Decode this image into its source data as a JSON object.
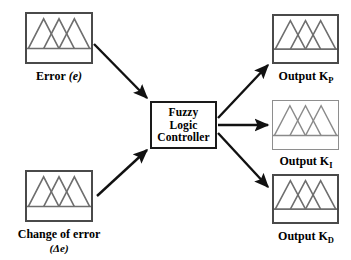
{
  "diagram": {
    "colors": {
      "background": "#ffffff",
      "box_border": "#4a4a4a",
      "box_border_light": "#8e8e8e",
      "controller_border": "#1a1a1a",
      "arrow": "#111111",
      "curve": "#6e6e6e",
      "text": "#000000"
    },
    "controller": {
      "line1": "Fuzzy",
      "line2": "Logic",
      "line3": "Controller"
    },
    "inputs": [
      {
        "id": "error",
        "label_main": "Error",
        "label_paren": "(e)",
        "label_sub": "",
        "plot": {
          "type": "membership-functions",
          "shape": "triangular",
          "count": 3,
          "peaks": [
            0.26,
            0.5,
            0.74
          ],
          "half_width": 0.24,
          "baseline": 0.72
        }
      },
      {
        "id": "change-of-error",
        "label_main": "Change of error",
        "label_paren": "(Δe)",
        "label_sub": "",
        "plot": {
          "type": "membership-functions",
          "shape": "triangular",
          "count": 3,
          "peaks": [
            0.26,
            0.5,
            0.74
          ],
          "half_width": 0.24,
          "baseline": 0.72
        }
      }
    ],
    "outputs": [
      {
        "id": "output-kp",
        "label_main": "Output K",
        "label_sub": "P",
        "plot": {
          "type": "membership-functions",
          "shape": "triangular",
          "count": 3,
          "peaks": [
            0.26,
            0.5,
            0.74
          ],
          "half_width": 0.24,
          "baseline": 0.72
        }
      },
      {
        "id": "output-ki",
        "label_main": "Output K",
        "label_sub": "I",
        "plot": {
          "type": "membership-functions",
          "shape": "triangular",
          "count": 3,
          "peaks": [
            0.26,
            0.5,
            0.74
          ],
          "half_width": 0.24,
          "baseline": 0.72
        }
      },
      {
        "id": "output-kd",
        "label_main": "Output K",
        "label_sub": "D",
        "plot": {
          "type": "membership-functions",
          "shape": "triangular",
          "count": 3,
          "peaks": [
            0.26,
            0.5,
            0.74
          ],
          "half_width": 0.24,
          "baseline": 0.72
        }
      }
    ],
    "connections": [
      {
        "id": "arrow-error-to-controller",
        "from": "error",
        "to": "controller"
      },
      {
        "id": "arrow-change-of-error-to-controller",
        "from": "change-of-error",
        "to": "controller"
      },
      {
        "id": "arrow-controller-to-output-kp",
        "from": "controller",
        "to": "output-kp"
      },
      {
        "id": "arrow-controller-to-output-ki",
        "from": "controller",
        "to": "output-ki"
      },
      {
        "id": "arrow-controller-to-output-kd",
        "from": "controller",
        "to": "output-kd"
      }
    ]
  }
}
